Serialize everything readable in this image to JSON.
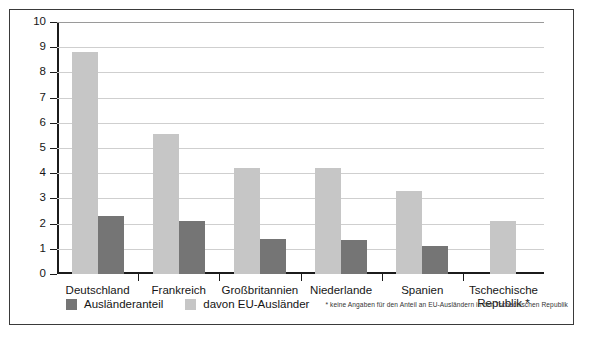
{
  "chart_data": {
    "type": "bar",
    "title": "",
    "subtitle": "",
    "xlabel": "",
    "ylabel": "",
    "ylim": [
      0,
      10
    ],
    "yticks": [
      "0",
      "1",
      "2",
      "3",
      "4",
      "5",
      "6",
      "7",
      "8",
      "9",
      "10"
    ],
    "grid": true,
    "legend_position": "bottom-left",
    "categories": [
      "Deutschland",
      "Frankreich",
      "Großbritannien",
      "Niederlande",
      "Spanien",
      "Tschechische\nRepublik *"
    ],
    "series": [
      {
        "name": "davon EU-Ausländer",
        "color": "#c6c6c6",
        "values": [
          8.8,
          5.55,
          4.2,
          4.2,
          3.3,
          2.1
        ]
      },
      {
        "name": "Ausländeranteil",
        "color": "#757575",
        "values": [
          2.3,
          2.1,
          1.4,
          1.35,
          1.1,
          null
        ]
      }
    ],
    "annotations": [
      "* keine Angaben für den Anteil an EU-Ausländern in der Tschechischen Republik"
    ]
  },
  "legend": {
    "entries": [
      {
        "label": "Ausländeranteil",
        "swatch": "dark"
      },
      {
        "label": "davon EU-Ausländer",
        "swatch": "light"
      }
    ],
    "footnote": "* keine Angaben für den Anteil an EU-Ausländern in der Tschechischen Republik"
  },
  "colors": {
    "series_light": "#c6c6c6",
    "series_dark": "#757575",
    "axis": "#1b1b1b",
    "grid": "#cfcfcf",
    "border": "#3a3a3a",
    "background": "#ffffff"
  }
}
